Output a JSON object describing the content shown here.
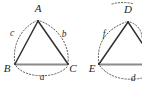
{
  "figure": {
    "background_color": "#ffffff",
    "edge_color": "#33312f",
    "base_edge_color": "#8a8a8a",
    "arc_color": "#4a4a4a",
    "label_color": "#262626"
  },
  "triangles": [
    {
      "id": "triangle-abc",
      "vertices": [
        {
          "name": "A",
          "label": "A",
          "x": 38,
          "y": 21,
          "label_x": 38,
          "label_y": 12
        },
        {
          "name": "B",
          "label": "B",
          "x": 15,
          "y": 64,
          "label_x": 7,
          "label_y": 72
        },
        {
          "name": "C",
          "label": "C",
          "x": 68,
          "y": 64,
          "label_x": 73,
          "label_y": 72
        }
      ],
      "sides": [
        {
          "name": "a",
          "label": "a",
          "between": "B-C",
          "label_x": 42,
          "label_y": 80
        },
        {
          "name": "b",
          "label": "b",
          "between": "A-C",
          "label_x": 64,
          "label_y": 37
        },
        {
          "name": "c",
          "label": "c",
          "between": "A-B",
          "label_x": 12,
          "label_y": 36
        }
      ]
    },
    {
      "id": "triangle-def",
      "vertices": [
        {
          "name": "D",
          "label": "D",
          "x": 128,
          "y": 22,
          "label_x": 128,
          "label_y": 13
        },
        {
          "name": "E",
          "label": "E",
          "x": 99,
          "y": 64,
          "label_x": 92,
          "label_y": 72
        }
      ],
      "sides": [
        {
          "name": "d",
          "label": "d",
          "between": "E-F",
          "label_x": 133,
          "label_y": 81
        },
        {
          "name": "f",
          "label": "f",
          "between": "D-E",
          "label_x": 104,
          "label_y": 37
        }
      ]
    }
  ]
}
